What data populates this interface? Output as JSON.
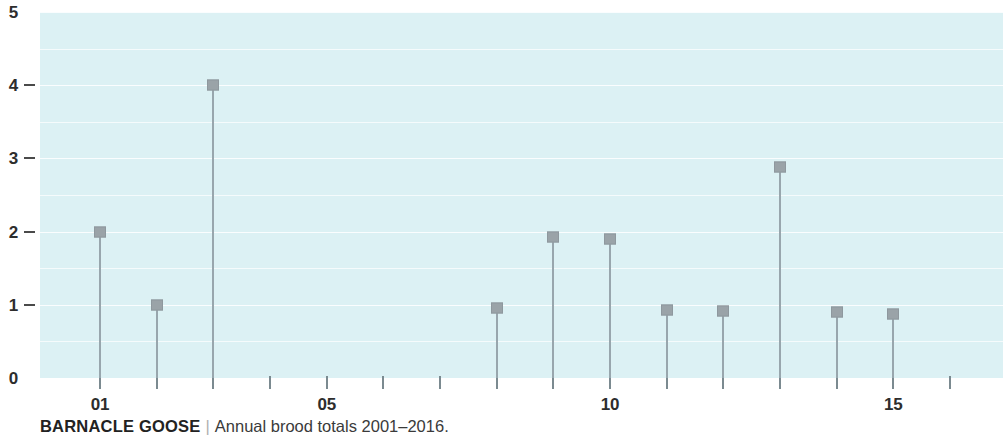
{
  "caption": {
    "title": "BARNACLE GOOSE",
    "separator": "|",
    "subtitle": "Annual brood totals 2001–2016."
  },
  "colors": {
    "plot_background": "#dcf1f4",
    "marker": "#9aa3a8",
    "stem": "#98a6ad",
    "gridline": "#ffffff",
    "axis_text": "#2d2d2d",
    "tick": "#7b8a90"
  },
  "chart_data": {
    "type": "line",
    "subtype": "stem-lollipop",
    "title": "BARNACLE GOOSE",
    "subtitle": "Annual brood totals 2001–2016.",
    "xlabel": "",
    "ylabel": "",
    "ylim": [
      0,
      5
    ],
    "xlim": [
      2001,
      2016
    ],
    "grid": true,
    "grid_interval": 0.5,
    "legend": "none",
    "y_ticks": [
      {
        "value": 0,
        "label": "0",
        "dash": false
      },
      {
        "value": 1,
        "label": "1",
        "dash": true
      },
      {
        "value": 2,
        "label": "2",
        "dash": true
      },
      {
        "value": 3,
        "label": "3",
        "dash": true
      },
      {
        "value": 4,
        "label": "4",
        "dash": true
      },
      {
        "value": 5,
        "label": "5",
        "dash": false
      }
    ],
    "x_ticks": [
      {
        "value": 2001,
        "label": "01"
      },
      {
        "value": 2002,
        "label": ""
      },
      {
        "value": 2003,
        "label": ""
      },
      {
        "value": 2004,
        "label": ""
      },
      {
        "value": 2005,
        "label": "05"
      },
      {
        "value": 2006,
        "label": ""
      },
      {
        "value": 2007,
        "label": ""
      },
      {
        "value": 2008,
        "label": ""
      },
      {
        "value": 2009,
        "label": ""
      },
      {
        "value": 2010,
        "label": "10"
      },
      {
        "value": 2011,
        "label": ""
      },
      {
        "value": 2012,
        "label": ""
      },
      {
        "value": 2013,
        "label": ""
      },
      {
        "value": 2014,
        "label": ""
      },
      {
        "value": 2015,
        "label": "15"
      },
      {
        "value": 2016,
        "label": ""
      }
    ],
    "x": [
      2001,
      2002,
      2003,
      2004,
      2005,
      2006,
      2007,
      2008,
      2009,
      2010,
      2011,
      2012,
      2013,
      2014,
      2015,
      2016
    ],
    "values": [
      2,
      1,
      4,
      0,
      0,
      0,
      0,
      0.95,
      1.92,
      1.9,
      0.93,
      0.92,
      2.88,
      0.9,
      0.88,
      0
    ]
  }
}
